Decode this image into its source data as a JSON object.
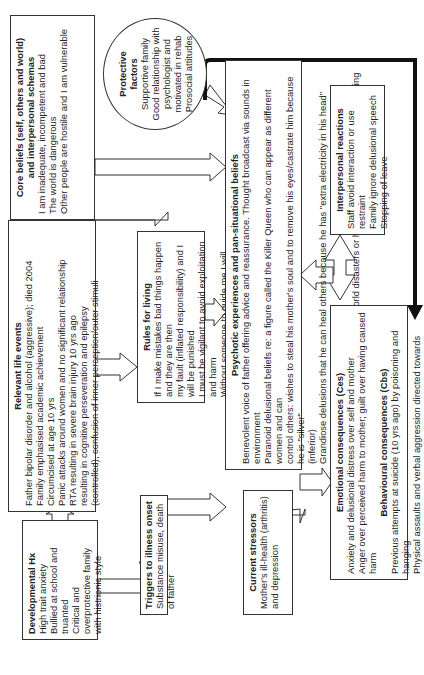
{
  "developmental": {
    "title": "Developmental Hx",
    "lines": [
      "High trait anxiety",
      "Bullied at school and",
      "truanted",
      "Critical and",
      "overprotective family",
      "with histrionic style"
    ]
  },
  "life_events": {
    "title": "Relevant life events",
    "lines": [
      "Father bipolar disorder and alcohol (aggressive); died 2004",
      "Family emphasised academic achievement",
      "Circumcised at age 10 yrs",
      "Panic attacks around women and no significant relationship",
      "RTA resulting in severe brain injury 10 yrs ago",
      "resulting in cognitive perseveration and epilepsy",
      "(controlled), confusion of inner perception/outer stimuli"
    ]
  },
  "core_beliefs": {
    "title": "Core beliefs (self, others and world)",
    "subtitle": "and interpersonal schemas",
    "lines": [
      "I am inadequate, incompetent and bad",
      "The world is dangerous",
      "Other people are hostile and I am vulnerable"
    ]
  },
  "protective": {
    "title_1": "Protective",
    "title_2": "factors",
    "lines": [
      "Supportive family",
      "Good relationship with",
      "psychologist and",
      "motivated in rehab",
      "Prosocial attitudes"
    ]
  },
  "rules": {
    "title": "Rules for living",
    "lines": [
      "If I make mistakes bad things happen and they are then",
      "my fault (inflated responsibility) and I will be punished",
      "I must be vigilant to avoid exploitation and harm",
      "Without someone to guide me I will not survive"
    ]
  },
  "triggers": {
    "title": "Triggers to illness onset",
    "lines": [
      "Substance misuse, death of father"
    ]
  },
  "psychotic": {
    "title": "Psychotic experiences and pan-situational beliefs",
    "lines": [
      "Benevolent voice of father offering advice and reassurance. Thought broadcast via sounds in environment",
      "Paranoid delusional beliefs re: a figure called the Killer Queen who can appear as different women and can",
      "control others: wishes to steal his mother's soul and to remove his eyes/castrate him because he is \"silver\"",
      "(inferior)",
      "Grandiose delusions that he can heal others because he has \"extra electricity in his head\" which can be",
      "utilised by turning a dial on his watch",
      "Delusions of guilt re: having caused world disasters or having accidentally hurt others by trying to heal them"
    ]
  },
  "stressors": {
    "title": "Current stressors",
    "lines": [
      "Mother's ill-health (arthritis)",
      "and depression"
    ]
  },
  "consequences": {
    "emotional_title": "Emotional consequences (Ces)",
    "emotional_lines": [
      "Anxiety and delusional distress over self and mother",
      "Anger over perceived harm to mother; guilt over having caused harm"
    ],
    "behavioural_title": "Behavioural consequences (Cbs)",
    "behavioural_lines": [
      "Previous attempts at suicide (10 yrs ago) by poisoning and hanging",
      "Physical assaults and verbal aggression directed towards patients and",
      "damage to property (punching walls/windows)"
    ]
  },
  "interpersonal": {
    "title": "Interpersonal reactions",
    "lines": [
      "Staff avoid interaction or use restraint",
      "Family ignore delusional speech",
      "Stopping of leave"
    ]
  }
}
